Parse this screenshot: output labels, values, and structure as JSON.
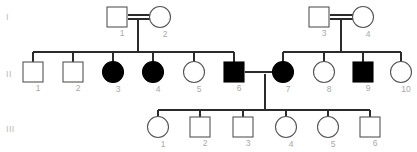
{
  "figure": {
    "type": "pedigree-chart",
    "width": 417,
    "height": 152,
    "background_color": "#ffffff",
    "line_color": "#2b2b2b",
    "label_color": "#a8a8a8",
    "affected_fill": "#000000",
    "unaffected_fill": "#ffffff"
  },
  "generations": [
    {
      "label": "I",
      "y": 16
    },
    {
      "label": "II",
      "y": 73
    },
    {
      "label": "III",
      "y": 128
    }
  ],
  "legend_semantics": {
    "square": "male",
    "circle": "female",
    "filled": "affected",
    "open": "unaffected",
    "double_line": "consanguineous-mating",
    "single_line": "mating"
  },
  "individuals": [
    {
      "id": "I-1",
      "number": "1",
      "sex": "male",
      "shape": "square",
      "affected": false,
      "x": 117,
      "y": 17,
      "generation": "I"
    },
    {
      "id": "I-2",
      "number": "2",
      "sex": "female",
      "shape": "circle",
      "affected": false,
      "x": 160,
      "y": 17,
      "generation": "I"
    },
    {
      "id": "I-3",
      "number": "3",
      "sex": "male",
      "shape": "square",
      "affected": false,
      "x": 319,
      "y": 17,
      "generation": "I"
    },
    {
      "id": "I-4",
      "number": "4",
      "sex": "female",
      "shape": "circle",
      "affected": false,
      "x": 363,
      "y": 17,
      "generation": "I"
    },
    {
      "id": "II-1",
      "number": "1",
      "sex": "male",
      "shape": "square",
      "affected": false,
      "x": 33,
      "y": 72,
      "generation": "II"
    },
    {
      "id": "II-2",
      "number": "2",
      "sex": "male",
      "shape": "square",
      "affected": false,
      "x": 73,
      "y": 72,
      "generation": "II"
    },
    {
      "id": "II-3",
      "number": "3",
      "sex": "female",
      "shape": "circle",
      "affected": true,
      "x": 113,
      "y": 72,
      "generation": "II"
    },
    {
      "id": "II-4",
      "number": "4",
      "sex": "female",
      "shape": "circle",
      "affected": true,
      "x": 153,
      "y": 72,
      "generation": "II"
    },
    {
      "id": "II-5",
      "number": "5",
      "sex": "female",
      "shape": "circle",
      "affected": false,
      "x": 194,
      "y": 72,
      "generation": "II"
    },
    {
      "id": "II-6",
      "number": "6",
      "sex": "male",
      "shape": "square",
      "affected": true,
      "x": 234,
      "y": 72,
      "generation": "II"
    },
    {
      "id": "II-7",
      "number": "7",
      "sex": "female",
      "shape": "circle",
      "affected": true,
      "x": 283,
      "y": 72,
      "generation": "II"
    },
    {
      "id": "II-8",
      "number": "8",
      "sex": "female",
      "shape": "circle",
      "affected": false,
      "x": 324,
      "y": 72,
      "generation": "II"
    },
    {
      "id": "II-9",
      "number": "9",
      "sex": "male",
      "shape": "square",
      "affected": true,
      "x": 363,
      "y": 72,
      "generation": "II"
    },
    {
      "id": "II-10",
      "number": "10",
      "sex": "female",
      "shape": "circle",
      "affected": false,
      "x": 401,
      "y": 72,
      "generation": "II"
    },
    {
      "id": "III-1",
      "number": "1",
      "sex": "female",
      "shape": "circle",
      "affected": false,
      "x": 158,
      "y": 127,
      "generation": "III"
    },
    {
      "id": "III-2",
      "number": "2",
      "sex": "male",
      "shape": "square",
      "affected": false,
      "x": 200,
      "y": 127,
      "generation": "III"
    },
    {
      "id": "III-3",
      "number": "3",
      "sex": "male",
      "shape": "square",
      "affected": false,
      "x": 243,
      "y": 127,
      "generation": "III"
    },
    {
      "id": "III-4",
      "number": "4",
      "sex": "female",
      "shape": "circle",
      "affected": false,
      "x": 286,
      "y": 127,
      "generation": "III"
    },
    {
      "id": "III-5",
      "number": "5",
      "sex": "female",
      "shape": "circle",
      "affected": false,
      "x": 328,
      "y": 127,
      "generation": "III"
    },
    {
      "id": "III-6",
      "number": "6",
      "sex": "male",
      "shape": "square",
      "affected": false,
      "x": 370,
      "y": 127,
      "generation": "III"
    }
  ],
  "matings": [
    {
      "id": "mating-I-1-I-2",
      "partners": [
        "I-1",
        "I-2"
      ],
      "consanguineous": true,
      "x1": 128,
      "x2": 150,
      "y": 17,
      "descent_x": 138,
      "descent_y2": 52
    },
    {
      "id": "mating-I-3-I-4",
      "partners": [
        "I-3",
        "I-4"
      ],
      "consanguineous": true,
      "x1": 330,
      "x2": 353,
      "y": 17,
      "descent_x": 341,
      "descent_y2": 52
    },
    {
      "id": "mating-II-6-II-7",
      "partners": [
        "II-6",
        "II-7"
      ],
      "consanguineous": false,
      "x1": 245,
      "x2": 272,
      "y": 72,
      "descent_x": 265,
      "descent_y2": 110
    }
  ],
  "sibships": [
    {
      "id": "sibship-gen2-left",
      "parents": "mating-I-1-I-2",
      "y": 52,
      "x_from": 33,
      "x_to": 234,
      "children": [
        "II-1",
        "II-2",
        "II-3",
        "II-4",
        "II-5",
        "II-6"
      ]
    },
    {
      "id": "sibship-gen2-right",
      "parents": "mating-I-3-I-4",
      "y": 52,
      "x_from": 283,
      "x_to": 401,
      "children": [
        "II-7",
        "II-8",
        "II-9",
        "II-10"
      ]
    },
    {
      "id": "sibship-gen3",
      "parents": "mating-II-6-II-7",
      "y": 110,
      "x_from": 158,
      "x_to": 370,
      "children": [
        "III-1",
        "III-2",
        "III-3",
        "III-4",
        "III-5",
        "III-6"
      ]
    }
  ],
  "symbol_geometry": {
    "square_size": 20,
    "circle_radius": 10.5,
    "stub_length": 10
  }
}
